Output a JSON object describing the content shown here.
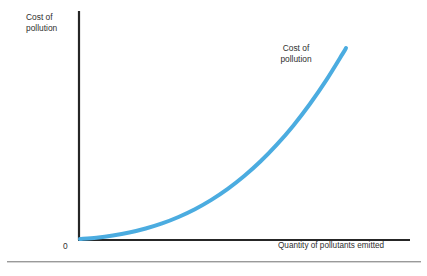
{
  "figure": {
    "background_color": "#ffffff",
    "top_crop_remnant": "Cost of pollution rises as pollutants emitted",
    "bottom_rule_color": "#9a9a9a"
  },
  "axes": {
    "color": "#262626",
    "origin_label": "0",
    "y_axis_title": "Cost of\npollution",
    "x_axis_title": "Quantity of pollutants emitted"
  },
  "curve": {
    "label": "Cost of\npollution",
    "color": "#4BACE0",
    "width_px": 4
  },
  "chart_data": {
    "type": "line",
    "title": "",
    "subtitle": "",
    "xlabel": "Quantity of pollutants emitted",
    "ylabel": "Cost of pollution",
    "grid": false,
    "legend_position": "inline-annotation",
    "xlim": [
      0,
      100
    ],
    "ylim": [
      0,
      100
    ],
    "x_tick_labels": [
      "0"
    ],
    "y_tick_labels": [],
    "annotations": [
      {
        "text": "Cost of pollution",
        "x": 72,
        "y": 83,
        "target": "curve"
      }
    ],
    "series": [
      {
        "name": "Cost of pollution",
        "color": "#4BACE0",
        "shape": "convex-increasing",
        "x": [
          0,
          5,
          10,
          15,
          20,
          25,
          30,
          35,
          40,
          45,
          50,
          55,
          60,
          65,
          70,
          75,
          80,
          81
        ],
        "y": [
          0,
          0.5,
          1.3,
          2.4,
          3.9,
          5.8,
          8.2,
          11.1,
          14.6,
          18.7,
          23.5,
          29.0,
          35.3,
          42.4,
          50.4,
          59.3,
          69.2,
          71.3
        ]
      }
    ]
  }
}
